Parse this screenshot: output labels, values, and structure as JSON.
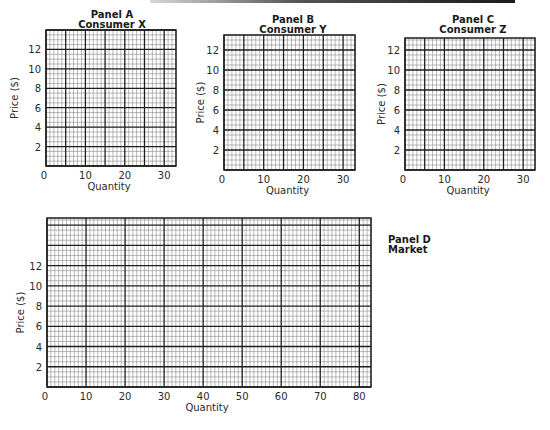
{
  "header": {
    "bar_color": "#1a1a1a"
  },
  "colors": {
    "major_line": "#1e1e1e",
    "minor_line": "#8a8a8a",
    "text": "#2a2a2a"
  },
  "panels": [
    {
      "id": "A",
      "title_line1": "Panel A",
      "title_line2": "Consumer X",
      "xlabel": "Quantity",
      "ylabel": "Price ($)",
      "x_ticks": [
        "0",
        "10",
        "20",
        "30"
      ],
      "y_ticks": [
        "2",
        "4",
        "6",
        "8",
        "10",
        "12"
      ]
    },
    {
      "id": "B",
      "title_line1": "Panel B",
      "title_line2": "Consumer Y",
      "xlabel": "Quantity",
      "ylabel": "Price ($)",
      "x_ticks": [
        "0",
        "10",
        "20",
        "30"
      ],
      "y_ticks": [
        "2",
        "4",
        "6",
        "8",
        "10",
        "12"
      ]
    },
    {
      "id": "C",
      "title_line1": "Panel C",
      "title_line2": "Consumer Z",
      "xlabel": "Quantity",
      "ylabel": "Price ($)",
      "x_ticks": [
        "0",
        "10",
        "20",
        "30"
      ],
      "y_ticks": [
        "2",
        "4",
        "6",
        "8",
        "10",
        "12"
      ]
    },
    {
      "id": "D",
      "title_line1": "Panel D",
      "title_line2": "Market",
      "xlabel": "Quantity",
      "ylabel": "Price ($)",
      "x_ticks": [
        "0",
        "10",
        "20",
        "30",
        "40",
        "50",
        "60",
        "70",
        "80"
      ],
      "y_ticks": [
        "2",
        "4",
        "6",
        "8",
        "10",
        "12"
      ]
    }
  ],
  "chart_data": [
    {
      "type": "line",
      "title": "Panel A — Consumer X",
      "xlabel": "Quantity",
      "ylabel": "Price ($)",
      "xlim": [
        0,
        33
      ],
      "ylim": [
        0,
        14
      ],
      "x_ticks": [
        0,
        10,
        20,
        30
      ],
      "y_ticks": [
        2,
        4,
        6,
        8,
        10,
        12
      ],
      "grid": true,
      "grid_major": {
        "x": 5,
        "y": 2
      },
      "grid_minor": {
        "x": 1,
        "y": 0.5
      },
      "series": []
    },
    {
      "type": "line",
      "title": "Panel B — Consumer Y",
      "xlabel": "Quantity",
      "ylabel": "Price ($)",
      "xlim": [
        0,
        33
      ],
      "ylim": [
        0,
        13.5
      ],
      "x_ticks": [
        0,
        10,
        20,
        30
      ],
      "y_ticks": [
        2,
        4,
        6,
        8,
        10,
        12
      ],
      "grid": true,
      "grid_major": {
        "x": 5,
        "y": 2
      },
      "grid_minor": {
        "x": 1,
        "y": 0.5
      },
      "series": []
    },
    {
      "type": "line",
      "title": "Panel C — Consumer Z",
      "xlabel": "Quantity",
      "ylabel": "Price ($)",
      "xlim": [
        0,
        33
      ],
      "ylim": [
        0,
        13.2
      ],
      "x_ticks": [
        0,
        10,
        20,
        30
      ],
      "y_ticks": [
        2,
        4,
        6,
        8,
        10,
        12
      ],
      "grid": true,
      "grid_major": {
        "x": 5,
        "y": 2
      },
      "grid_minor": {
        "x": 1,
        "y": 0.5
      },
      "series": []
    },
    {
      "type": "line",
      "title": "Panel D — Market",
      "xlabel": "Quantity",
      "ylabel": "Price ($)",
      "xlim": [
        0,
        83
      ],
      "ylim": [
        0,
        16.7
      ],
      "x_ticks": [
        0,
        10,
        20,
        30,
        40,
        50,
        60,
        70,
        80
      ],
      "y_ticks": [
        2,
        4,
        6,
        8,
        10,
        12
      ],
      "grid": true,
      "grid_major": {
        "x": 10,
        "y": 2
      },
      "grid_minor": {
        "x": 1,
        "y": 0.5
      },
      "series": []
    }
  ]
}
